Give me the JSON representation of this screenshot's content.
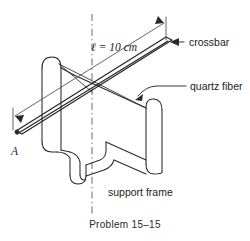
{
  "figure": {
    "caption": "Problem 15–15",
    "labels": {
      "length": "ℓ = 10 cm",
      "crossbar": "crossbar",
      "quartz_fiber": "quartz fiber",
      "support_frame": "support frame",
      "point_a": "A"
    },
    "colors": {
      "background": "#ffffff",
      "ink": "#2a2a2a",
      "text": "#1b1b1b",
      "axis": "#5a5a5a"
    },
    "icons": {
      "crossbar_leader": "arrow-left-icon",
      "fiber_leader": "arrow-down-left-icon",
      "dimension_left": "arrow-down-right-icon",
      "dimension_right": "arrow-up-right-icon",
      "axis": "dash-dot-centerline-icon"
    }
  }
}
